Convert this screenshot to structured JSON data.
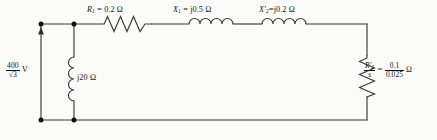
{
  "diagram": {
    "background_color": "#fbfbfa",
    "line_color": "#3a3a3a",
    "text_color": "#141414"
  },
  "source": {
    "name": "voltage-source",
    "numerator": "400",
    "denominator": "√3",
    "unit": "V",
    "full_text": "400/√3 V",
    "arrow_direction": "up"
  },
  "components": {
    "stator_resistance": {
      "symbol": "R",
      "subscript": "1",
      "prime": "",
      "equals": "=",
      "value": "0.2",
      "unit": "Ω",
      "full_text": "R₁ = 0.2 Ω",
      "type": "resistor"
    },
    "stator_reactance": {
      "symbol": "X",
      "subscript": "1",
      "prime": "",
      "equals": "=",
      "value": "j0.5",
      "unit": "Ω",
      "full_text": "X₁ = j0.5 Ω",
      "type": "inductor"
    },
    "rotor_reactance": {
      "symbol": "X",
      "subscript": "2",
      "prime": "′",
      "equals": "=",
      "value": "j0.2",
      "unit": "Ω",
      "full_text": "X₂′ = j0.2 Ω",
      "type": "inductor"
    },
    "magnetizing_reactance": {
      "value": "j20",
      "unit": "Ω",
      "full_text": "j20 Ω",
      "type": "inductor"
    },
    "rotor_load_resistance": {
      "symbol": "R",
      "subscript": "2",
      "prime": "′",
      "slip_symbol": "s",
      "equals": "=",
      "value_numerator": "0.1",
      "value_denominator": "0.025",
      "unit": "Ω",
      "full_text": "R₂′/s = 0.1/0.025 Ω",
      "type": "resistor"
    }
  },
  "nodes": {
    "count": 4,
    "label": "junction-dot"
  }
}
